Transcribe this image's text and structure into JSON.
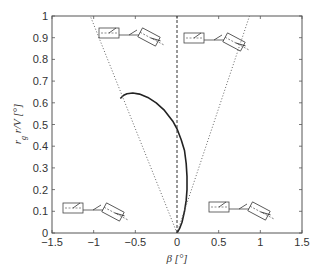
{
  "chart_data": {
    "type": "line",
    "title": "",
    "xlabel": "β [°]",
    "ylabel": "r_g r/V [°]",
    "xlim": [
      -1.5,
      1.5
    ],
    "ylim": [
      0,
      1
    ],
    "grid": false,
    "legend": null,
    "xticks": [
      "-1.5",
      "-1",
      "-0.5",
      "0",
      "0.5",
      "1",
      "1.5"
    ],
    "yticks": [
      "0",
      "0.1",
      "0.2",
      "0.3",
      "0.4",
      "0.5",
      "0.6",
      "0.7",
      "0.8",
      "0.9",
      "1"
    ],
    "series": [
      {
        "name": "trajectory",
        "style": "solid",
        "x": [
          -0.68,
          -0.64,
          -0.6,
          -0.53,
          -0.45,
          -0.35,
          -0.25,
          -0.15,
          -0.05,
          0.0,
          0.05,
          0.09,
          0.11,
          0.12,
          0.12,
          0.11,
          0.09,
          0.06,
          0.03,
          0.0
        ],
        "y": [
          0.62,
          0.635,
          0.642,
          0.645,
          0.64,
          0.625,
          0.6,
          0.565,
          0.515,
          0.48,
          0.43,
          0.38,
          0.32,
          0.26,
          0.2,
          0.15,
          0.1,
          0.05,
          0.02,
          0.0
        ]
      },
      {
        "name": "left boundary",
        "style": "dotted",
        "x": [
          0.0,
          -1.04
        ],
        "y": [
          0.0,
          1.0
        ]
      },
      {
        "name": "right boundary",
        "style": "dotted",
        "x": [
          0.0,
          0.87
        ],
        "y": [
          0.0,
          1.0
        ]
      },
      {
        "name": "beta zero",
        "style": "dashed",
        "x": [
          0.0,
          0.0
        ],
        "y": [
          0.0,
          1.0
        ]
      }
    ],
    "annotations": [
      {
        "type": "vehicle-diagram",
        "quadrant": "top-left",
        "x": -0.6,
        "y": 0.93
      },
      {
        "type": "vehicle-diagram",
        "quadrant": "top-right",
        "x": 0.55,
        "y": 0.92
      },
      {
        "type": "vehicle-diagram",
        "quadrant": "bottom-left",
        "x": -1.05,
        "y": 0.12
      },
      {
        "type": "vehicle-diagram",
        "quadrant": "bottom-right",
        "x": 0.75,
        "y": 0.12
      }
    ]
  }
}
